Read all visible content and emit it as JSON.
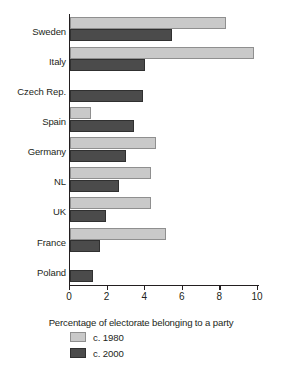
{
  "chart_data": {
    "type": "bar",
    "orientation": "horizontal",
    "title": "",
    "xlabel": "Percentage of electorate belonging to a party",
    "ylabel": "",
    "xlim": [
      0,
      10
    ],
    "xticks": [
      0,
      2,
      4,
      6,
      8,
      10
    ],
    "xtick_labels": [
      "0",
      "2",
      "4",
      "6",
      "8",
      "10"
    ],
    "grid": false,
    "legend_position": "below",
    "categories": [
      "Sweden",
      "Italy",
      "Czech Rep.",
      "Spain",
      "Germany",
      "NL",
      "UK",
      "France",
      "Poland"
    ],
    "series": [
      {
        "name": "c. 1980",
        "color": "#c9c9c9",
        "values": [
          8.3,
          9.8,
          0.0,
          1.1,
          4.6,
          4.3,
          4.3,
          5.1,
          0.0
        ]
      },
      {
        "name": "c. 2000",
        "color": "#4b4b4b",
        "values": [
          5.4,
          4.0,
          3.9,
          3.4,
          3.0,
          2.6,
          1.9,
          1.6,
          1.2
        ]
      }
    ]
  },
  "legend": {
    "items": [
      {
        "label": "c. 1980",
        "color": "#c9c9c9"
      },
      {
        "label": "c. 2000",
        "color": "#4b4b4b"
      }
    ]
  }
}
